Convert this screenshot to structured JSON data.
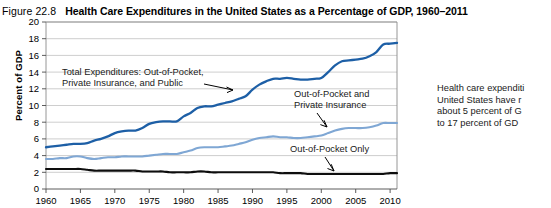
{
  "figure": {
    "number": "Figure 22.8",
    "title": "Health Care Expenditures in the United States as a Percentage of GDP, 1960–2011"
  },
  "caption": {
    "line1": "Health care expenditi",
    "line2": "United States have r",
    "line3": "about 5 percent of G",
    "line4": "to 17 percent of GD"
  },
  "annotations": {
    "total": {
      "line1": "Total Expenditures: Out-of-Pocket,",
      "line2": "Private Insurance, and Public"
    },
    "oop_private": {
      "line1": "Out-of-Pocket and",
      "line2": "Private Insurance"
    },
    "oop_only": {
      "line1": "Out-of-Pocket Only"
    }
  },
  "colors": {
    "total": "#1d5fa6",
    "oop_private": "#7fa7d4",
    "oop_only": "#0d0d0d",
    "grid": "#b9b9b9",
    "frame": "#8a8a8a"
  },
  "chart_data": {
    "type": "line",
    "title": "Health Care Expenditures in the United States as a Percentage of GDP, 1960–2011",
    "xlabel": "",
    "ylabel": "Percent of GDP",
    "xlim": [
      1960,
      2011
    ],
    "ylim": [
      0,
      20
    ],
    "grid": true,
    "legend_position": "inline-annotations",
    "ytick_labels": [
      "0",
      "2",
      "4",
      "6",
      "8",
      "10",
      "12",
      "14",
      "16",
      "18",
      "20"
    ],
    "yticks": [
      0,
      2,
      4,
      6,
      8,
      10,
      12,
      14,
      16,
      18,
      20
    ],
    "xtick_labels": [
      "1960",
      "1965",
      "1970",
      "1975",
      "1980",
      "1985",
      "1990",
      "1995",
      "2000",
      "2005",
      "2010"
    ],
    "xticks": [
      1960,
      1965,
      1970,
      1975,
      1980,
      1985,
      1990,
      1995,
      2000,
      2005,
      2010
    ],
    "x": [
      1960,
      1961,
      1962,
      1963,
      1964,
      1965,
      1966,
      1967,
      1968,
      1969,
      1970,
      1971,
      1972,
      1973,
      1974,
      1975,
      1976,
      1977,
      1978,
      1979,
      1980,
      1981,
      1982,
      1983,
      1984,
      1985,
      1986,
      1987,
      1988,
      1989,
      1990,
      1991,
      1992,
      1993,
      1994,
      1995,
      1996,
      1997,
      1998,
      1999,
      2000,
      2001,
      2002,
      2003,
      2004,
      2005,
      2006,
      2007,
      2008,
      2009,
      2010,
      2011
    ],
    "series": [
      {
        "name": "Total Expenditures: Out-of-Pocket, Private Insurance, and Public",
        "color": "#1d5fa6",
        "values": [
          5.0,
          5.1,
          5.2,
          5.3,
          5.4,
          5.4,
          5.5,
          5.8,
          6.0,
          6.3,
          6.7,
          6.9,
          7.0,
          7.0,
          7.3,
          7.8,
          8.0,
          8.1,
          8.1,
          8.1,
          8.7,
          9.1,
          9.7,
          9.9,
          9.9,
          10.1,
          10.3,
          10.5,
          10.8,
          11.1,
          11.9,
          12.5,
          12.9,
          13.2,
          13.2,
          13.3,
          13.2,
          13.1,
          13.1,
          13.2,
          13.3,
          14.0,
          14.8,
          15.3,
          15.4,
          15.5,
          15.6,
          15.9,
          16.4,
          17.3,
          17.4,
          17.5
        ]
      },
      {
        "name": "Out-of-Pocket and Private Insurance",
        "color": "#7fa7d4",
        "values": [
          3.6,
          3.6,
          3.7,
          3.7,
          3.9,
          3.9,
          3.7,
          3.6,
          3.7,
          3.8,
          3.8,
          3.9,
          3.9,
          3.9,
          3.9,
          4.0,
          4.1,
          4.2,
          4.2,
          4.2,
          4.4,
          4.6,
          4.9,
          5.0,
          5.0,
          5.0,
          5.1,
          5.2,
          5.4,
          5.6,
          5.9,
          6.1,
          6.2,
          6.3,
          6.2,
          6.2,
          6.1,
          6.1,
          6.2,
          6.3,
          6.4,
          6.7,
          7.0,
          7.2,
          7.3,
          7.3,
          7.3,
          7.4,
          7.6,
          7.9,
          7.9,
          7.9
        ]
      },
      {
        "name": "Out-of-Pocket Only",
        "color": "#0d0d0d",
        "values": [
          2.4,
          2.4,
          2.4,
          2.4,
          2.4,
          2.4,
          2.3,
          2.2,
          2.2,
          2.2,
          2.2,
          2.2,
          2.2,
          2.2,
          2.1,
          2.1,
          2.1,
          2.1,
          2.0,
          2.0,
          2.0,
          2.0,
          2.1,
          2.1,
          2.0,
          2.0,
          2.0,
          2.0,
          2.0,
          2.0,
          2.0,
          2.0,
          2.0,
          2.0,
          1.9,
          1.9,
          1.9,
          1.9,
          1.8,
          1.8,
          1.8,
          1.8,
          1.8,
          1.8,
          1.8,
          1.8,
          1.8,
          1.8,
          1.8,
          1.8,
          1.9,
          1.9
        ]
      }
    ]
  }
}
